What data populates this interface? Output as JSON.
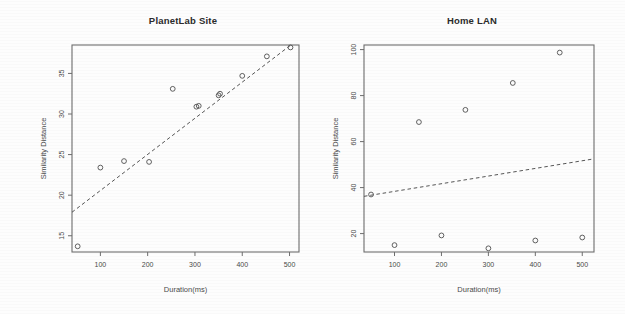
{
  "figure": {
    "background_color": "#fdfdfd",
    "ink_color": "#4f4f4f"
  },
  "chart_data": [
    {
      "type": "scatter",
      "title": "PlanetLab Site",
      "xlabel": "Duration(ms)",
      "ylabel": "Similarity Distance",
      "xlim": [
        40,
        520
      ],
      "ylim": [
        13,
        38.5
      ],
      "xticks": [
        100,
        200,
        300,
        400,
        500
      ],
      "yticks": [
        15,
        20,
        25,
        30,
        35
      ],
      "grid": false,
      "legend": "none",
      "points": [
        {
          "x": 52,
          "y": 13.7
        },
        {
          "x": 100,
          "y": 23.4
        },
        {
          "x": 150,
          "y": 24.2
        },
        {
          "x": 203,
          "y": 24.1
        },
        {
          "x": 253,
          "y": 33.1
        },
        {
          "x": 303,
          "y": 30.9
        },
        {
          "x": 308,
          "y": 31.0
        },
        {
          "x": 350,
          "y": 32.3
        },
        {
          "x": 353,
          "y": 32.5
        },
        {
          "x": 400,
          "y": 34.7
        },
        {
          "x": 452,
          "y": 37.1
        },
        {
          "x": 502,
          "y": 38.2
        }
      ],
      "fit_line": {
        "style": "dashed",
        "x0": 40,
        "y0": 17.9,
        "x1": 505,
        "y1": 38.6
      }
    },
    {
      "type": "scatter",
      "title": "Home LAN",
      "xlabel": "Duration(ms)",
      "ylabel": "Similarity Distance",
      "xlim": [
        35,
        525
      ],
      "ylim": [
        12,
        102
      ],
      "xticks": [
        100,
        200,
        300,
        400,
        500
      ],
      "yticks": [
        20,
        40,
        60,
        80,
        100
      ],
      "grid": false,
      "legend": "none",
      "points": [
        {
          "x": 50,
          "y": 37
        },
        {
          "x": 100,
          "y": 15
        },
        {
          "x": 152,
          "y": 68.5
        },
        {
          "x": 200,
          "y": 19.2
        },
        {
          "x": 251,
          "y": 73.8
        },
        {
          "x": 300,
          "y": 13.6
        },
        {
          "x": 352,
          "y": 85.5
        },
        {
          "x": 400,
          "y": 17
        },
        {
          "x": 452,
          "y": 98.7
        },
        {
          "x": 500,
          "y": 18.3
        }
      ],
      "fit_line": {
        "style": "dashed",
        "x0": 35,
        "y0": 36.2,
        "x1": 525,
        "y1": 52.5
      }
    }
  ]
}
